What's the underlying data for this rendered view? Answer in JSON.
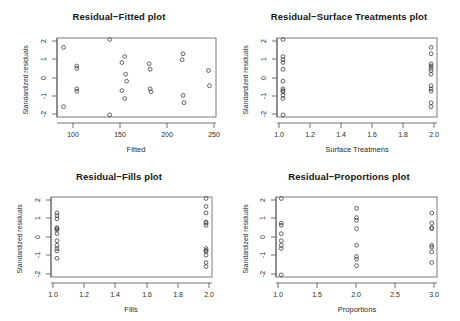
{
  "figure": {
    "background": "#ffffff",
    "point_color": "#3d3d3d",
    "axis_color": "#5a5a5a",
    "panel_layout": "2x2"
  },
  "chart_data": [
    {
      "type": "scatter",
      "title": "Residual−Fitted plot",
      "xlabel": "Fitted",
      "ylabel": "Standardized residuals",
      "xlim": [
        83,
        252
      ],
      "ylim": [
        -2.25,
        2.2
      ],
      "xticks": [
        100,
        150,
        200,
        250
      ],
      "xticklabels": [
        "100",
        "150",
        "200",
        "250"
      ],
      "yticks": [
        -2,
        -1,
        0,
        1,
        2
      ],
      "yticklabels": [
        "-2",
        "-1",
        "0",
        "1",
        "2"
      ],
      "grid": false,
      "legend": "none",
      "x": [
        90,
        90,
        104,
        104,
        104,
        104,
        139,
        139,
        152,
        152,
        155,
        155,
        156,
        157,
        181,
        182,
        182,
        183,
        216,
        217,
        217,
        218,
        244,
        245
      ],
      "y": [
        1.65,
        -1.6,
        0.63,
        0.5,
        -0.62,
        -0.75,
        2.08,
        -2.05,
        0.82,
        -0.72,
        1.15,
        -1.15,
        0.18,
        -0.2,
        0.75,
        0.45,
        -0.62,
        -0.78,
        0.98,
        1.3,
        -0.98,
        -1.38,
        0.38,
        -0.45
      ]
    },
    {
      "type": "scatter",
      "title": "Residual−Surface Treatments plot",
      "xlabel": "Surface Treatmens",
      "ylabel": "Standardized residuals",
      "xlim": [
        0.96,
        2.04
      ],
      "ylim": [
        -2.25,
        2.2
      ],
      "xticks": [
        1.0,
        1.2,
        1.4,
        1.6,
        1.8,
        2.0
      ],
      "xticklabels": [
        "1.0",
        "1.2",
        "1.4",
        "1.6",
        "1.8",
        "2.0"
      ],
      "yticks": [
        -2,
        -1,
        0,
        1,
        2
      ],
      "yticklabels": [
        "-2",
        "-1",
        "0",
        "1",
        "2"
      ],
      "grid": false,
      "legend": "none",
      "x": [
        1,
        1,
        1,
        1,
        1,
        1,
        1,
        1,
        1,
        1,
        1,
        1,
        2,
        2,
        2,
        2,
        2,
        2,
        2,
        2,
        2,
        2,
        2,
        2
      ],
      "y": [
        2.08,
        1.15,
        0.98,
        0.82,
        0.45,
        -0.2,
        -0.62,
        -0.72,
        -0.78,
        -0.98,
        -1.15,
        -2.05,
        1.65,
        1.3,
        0.75,
        0.63,
        0.5,
        0.38,
        0.18,
        -0.45,
        -0.62,
        -0.75,
        -1.38,
        -1.6
      ]
    },
    {
      "type": "scatter",
      "title": "Residual−Fills plot",
      "xlabel": "Fills",
      "ylabel": "Standardized residuals",
      "xlim": [
        0.96,
        2.04
      ],
      "ylim": [
        -2.25,
        2.2
      ],
      "xticks": [
        1.0,
        1.2,
        1.4,
        1.6,
        1.8,
        2.0
      ],
      "xticklabels": [
        "1.0",
        "1.2",
        "1.4",
        "1.6",
        "1.8",
        "2.0"
      ],
      "yticks": [
        -2,
        -1,
        0,
        1,
        2
      ],
      "yticklabels": [
        "-2",
        "-1",
        "0",
        "1",
        "2"
      ],
      "grid": false,
      "legend": "none",
      "x": [
        1,
        1,
        1,
        1,
        1,
        1,
        1,
        1,
        1,
        1,
        1,
        1,
        2,
        2,
        2,
        2,
        2,
        2,
        2,
        2,
        2,
        2,
        2,
        2
      ],
      "y": [
        1.3,
        1.15,
        0.98,
        0.5,
        0.45,
        0.38,
        0.18,
        -0.2,
        -0.45,
        -0.62,
        -0.75,
        -1.15,
        2.08,
        1.65,
        1.3,
        0.82,
        0.75,
        0.63,
        -0.62,
        -0.72,
        -0.78,
        -0.98,
        -1.38,
        -1.6,
        -2.05
      ]
    },
    {
      "type": "scatter",
      "title": "Residual−Proportions plot",
      "xlabel": "Proportions",
      "ylabel": "Standardized residuals",
      "xlim": [
        0.93,
        3.07
      ],
      "ylim": [
        -2.25,
        2.2
      ],
      "xticks": [
        1.0,
        1.5,
        2.0,
        2.5,
        3.0
      ],
      "xticklabels": [
        "1.0",
        "1.5",
        "2.0",
        "2.5",
        "3.0"
      ],
      "yticks": [
        -2,
        -1,
        0,
        1,
        2
      ],
      "yticklabels": [
        "-2",
        "-1",
        "0",
        "1",
        "2"
      ],
      "grid": false,
      "legend": "none",
      "x": [
        1,
        1,
        1,
        1,
        1,
        1,
        1,
        1,
        2,
        2,
        2,
        2,
        2,
        2,
        2,
        2,
        3,
        3,
        3,
        3,
        3,
        3,
        3,
        3
      ],
      "y": [
        2.08,
        0.75,
        0.63,
        0.18,
        -0.2,
        -0.45,
        -0.62,
        -2.05,
        1.55,
        1.05,
        0.9,
        0.45,
        -0.45,
        -1.05,
        -1.2,
        -1.55,
        1.3,
        0.75,
        0.5,
        0.45,
        -0.45,
        -0.55,
        -0.8,
        -1.38
      ]
    }
  ]
}
